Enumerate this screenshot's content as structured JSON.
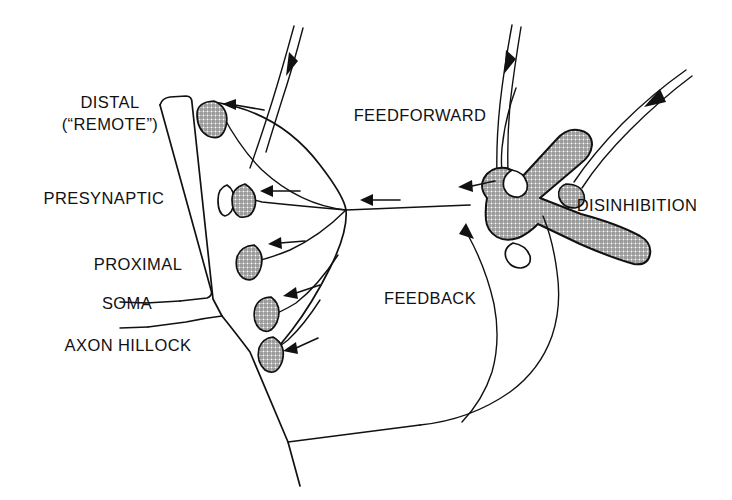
{
  "figure": {
    "background_color": "#ffffff",
    "ink_color": "#111111",
    "shading_color": "#8a8a8a"
  },
  "labels": {
    "distal": "DISTAL",
    "distal_sub": "(“REMOTE”)",
    "presynaptic": "PRESYNAPTIC",
    "proximal": "PROXIMAL",
    "soma": "SOMA",
    "axon_hillock": "AXON HILLOCK",
    "feedforward": "FEEDFORWARD",
    "feedback": "FEEDBACK",
    "disinhibition": "DISINHIBITION"
  },
  "structures": {
    "apical_dendrite": "apical-dendrite-trunk",
    "soma_body": "soma-body",
    "axon": "axon",
    "inhibitory_interneuron": "inhibitory-interneuron",
    "bouton_count": 5,
    "open_bouton_count": 1
  },
  "boutons": [
    {
      "id": "bouton-distal",
      "position": "distal",
      "shaded": true
    },
    {
      "id": "bouton-presynaptic",
      "position": "presynaptic",
      "shaded": true
    },
    {
      "id": "bouton-presynaptic-open",
      "position": "presynaptic",
      "shaded": false
    },
    {
      "id": "bouton-proximal",
      "position": "proximal",
      "shaded": true
    },
    {
      "id": "bouton-soma",
      "position": "soma",
      "shaded": true
    },
    {
      "id": "bouton-axon-hillock",
      "position": "axon-hillock",
      "shaded": true
    }
  ],
  "flow_arrows": [
    {
      "id": "arrow-distal",
      "direction": "left"
    },
    {
      "id": "arrow-presynaptic",
      "direction": "left"
    },
    {
      "id": "arrow-trunk",
      "direction": "left"
    },
    {
      "id": "arrow-proximal",
      "direction": "left"
    },
    {
      "id": "arrow-soma",
      "direction": "left-down"
    },
    {
      "id": "arrow-hillock",
      "direction": "left-down"
    },
    {
      "id": "arrow-feedforward-input-left",
      "direction": "down"
    },
    {
      "id": "arrow-feedforward-input-right",
      "direction": "down"
    },
    {
      "id": "arrow-disinhibition-input",
      "direction": "down-left"
    },
    {
      "id": "arrow-interneuron-output",
      "direction": "left"
    },
    {
      "id": "arrow-feedback-curve",
      "direction": "up-right"
    }
  ]
}
